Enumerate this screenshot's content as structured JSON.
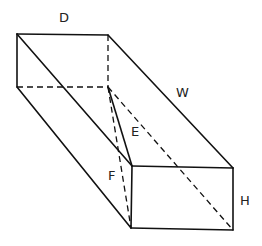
{
  "diagram": {
    "type": "rectangular-prism-with-diagonals",
    "labels": {
      "D": "D",
      "W": "W",
      "E": "E",
      "F": "F",
      "H": "H"
    },
    "colors": {
      "stroke": "#111111",
      "background": "#ffffff"
    }
  }
}
